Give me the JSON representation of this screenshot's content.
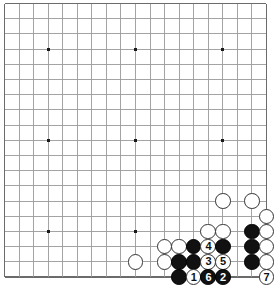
{
  "diagram": {
    "kind": "go-board-diagram",
    "board_size": 19,
    "geometry": {
      "origin_x": 4.5,
      "origin_y": 3.5,
      "step_x": 14.55,
      "step_y": 15.2,
      "stone_diameter": 15.6,
      "border_color": "#555555",
      "grid_color": "#9a9a9a",
      "edge_color": "#6b6b6b",
      "star_color": "#1a1a1a",
      "black_color": "#111111",
      "white_color": "#ffffff",
      "white_outline": "#333333"
    },
    "star_points": [
      {
        "col": 4,
        "row": 4
      },
      {
        "col": 10,
        "row": 4
      },
      {
        "col": 16,
        "row": 4
      },
      {
        "col": 4,
        "row": 10
      },
      {
        "col": 10,
        "row": 10
      },
      {
        "col": 16,
        "row": 10
      },
      {
        "col": 4,
        "row": 16
      },
      {
        "col": 10,
        "row": 16
      },
      {
        "col": 16,
        "row": 16
      }
    ],
    "stones": [
      {
        "col": 16,
        "row": 14,
        "color": "white",
        "label": ""
      },
      {
        "col": 18,
        "row": 14,
        "color": "white",
        "label": ""
      },
      {
        "col": 19,
        "row": 15,
        "color": "white",
        "label": ""
      },
      {
        "col": 15,
        "row": 16,
        "color": "white",
        "label": ""
      },
      {
        "col": 16,
        "row": 16,
        "color": "white",
        "label": ""
      },
      {
        "col": 18,
        "row": 16,
        "color": "black",
        "label": ""
      },
      {
        "col": 19,
        "row": 16,
        "color": "white",
        "label": ""
      },
      {
        "col": 12,
        "row": 17,
        "color": "white",
        "label": ""
      },
      {
        "col": 13,
        "row": 17,
        "color": "white",
        "label": ""
      },
      {
        "col": 14,
        "row": 17,
        "color": "black",
        "label": ""
      },
      {
        "col": 15,
        "row": 17,
        "color": "white",
        "label": "4"
      },
      {
        "col": 16,
        "row": 17,
        "color": "black",
        "label": ""
      },
      {
        "col": 18,
        "row": 17,
        "color": "black",
        "label": ""
      },
      {
        "col": 19,
        "row": 17,
        "color": "white",
        "label": ""
      },
      {
        "col": 10,
        "row": 18,
        "color": "white",
        "label": ""
      },
      {
        "col": 12,
        "row": 18,
        "color": "white",
        "label": ""
      },
      {
        "col": 13,
        "row": 18,
        "color": "black",
        "label": ""
      },
      {
        "col": 14,
        "row": 18,
        "color": "black",
        "label": ""
      },
      {
        "col": 15,
        "row": 18,
        "color": "white",
        "label": "3"
      },
      {
        "col": 16,
        "row": 18,
        "color": "white",
        "label": "5"
      },
      {
        "col": 18,
        "row": 18,
        "color": "black",
        "label": ""
      },
      {
        "col": 19,
        "row": 18,
        "color": "white",
        "label": ""
      },
      {
        "col": 13,
        "row": 19,
        "color": "black",
        "label": ""
      },
      {
        "col": 14,
        "row": 19,
        "color": "white",
        "label": "1"
      },
      {
        "col": 15,
        "row": 19,
        "color": "black",
        "label": "6"
      },
      {
        "col": 16,
        "row": 19,
        "color": "black",
        "label": "2"
      },
      {
        "col": 19,
        "row": 19,
        "color": "white",
        "label": "7"
      }
    ],
    "move_sequence": [
      {
        "label": "1",
        "color": "white",
        "col": 14,
        "row": 19
      },
      {
        "label": "2",
        "color": "black",
        "col": 16,
        "row": 19
      },
      {
        "label": "3",
        "color": "white",
        "col": 15,
        "row": 18
      },
      {
        "label": "4",
        "color": "white",
        "col": 15,
        "row": 17
      },
      {
        "label": "5",
        "color": "white",
        "col": 16,
        "row": 18
      },
      {
        "label": "6",
        "color": "black",
        "col": 15,
        "row": 19
      },
      {
        "label": "7",
        "color": "white",
        "col": 19,
        "row": 19
      }
    ]
  }
}
